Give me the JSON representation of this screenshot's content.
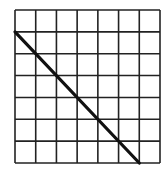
{
  "diagram": {
    "type": "grid-with-diagonal",
    "grid": {
      "columns": 7,
      "rows": 7,
      "left": 15,
      "top": 10,
      "right": 160,
      "bottom": 163,
      "line_color": "#222222"
    },
    "diagonal": {
      "start": {
        "col": 0,
        "row": 1
      },
      "end": {
        "col": 6,
        "row": 7
      },
      "color": "#111111"
    }
  }
}
